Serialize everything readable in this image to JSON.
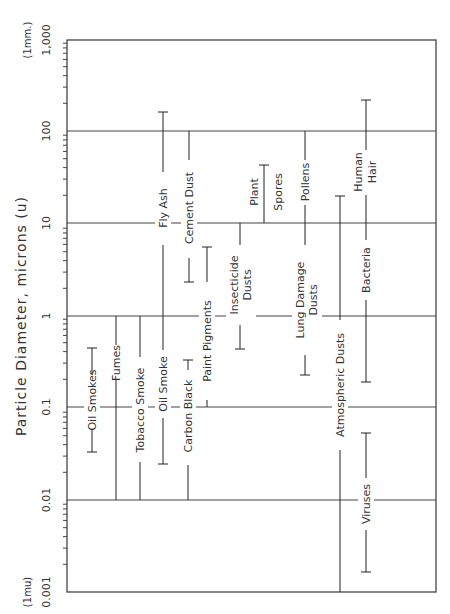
{
  "chart_data": {
    "type": "range-bar",
    "title": "",
    "ylabel": "Particle Diameter, microns (u)",
    "ylim": [
      0.001,
      1000
    ],
    "yscale": "log",
    "orientation": "rotated-90-ccw",
    "y_major_ticks": [
      "0.001",
      "0.01",
      "0.1",
      "1",
      "10",
      "100",
      "1,000"
    ],
    "y_minor_tick_labels": [
      "2",
      "3",
      "4",
      "5",
      "6",
      "8"
    ],
    "y_annotations": {
      "top": "(1mm.)",
      "bottom": "(1mu)"
    },
    "grid": "horizontal lines at each decade",
    "series": [
      {
        "name": "Oil Smokes",
        "min": 0.03,
        "max": 0.45
      },
      {
        "name": "Fumes",
        "min": 0.01,
        "max": 1
      },
      {
        "name": "Tobacco Smoke",
        "min": 0.01,
        "max": 1
      },
      {
        "name": "Oil Smoke",
        "min": 0.025,
        "max": 1
      },
      {
        "name": "Fly Ash",
        "min": 1,
        "max": 160
      },
      {
        "name": "Carbon Black",
        "min": 0.01,
        "max": 0.3
      },
      {
        "name": "Cement Dust",
        "min": 3,
        "max": 100
      },
      {
        "name": "Paint Pigments",
        "min": 0.1,
        "max": 5.5
      },
      {
        "name": "Insecticide Dusts",
        "min": 0.45,
        "max": 10
      },
      {
        "name": "Plant Spores",
        "min": 10,
        "max": 45
      },
      {
        "name": "Lung Damage Dusts",
        "min": 0.25,
        "max": 10
      },
      {
        "name": "Pollens",
        "min": 10,
        "max": 100
      },
      {
        "name": "Atmospheric Dusts",
        "min": 0.001,
        "max": 20
      },
      {
        "name": "Bacteria",
        "min": 0.2,
        "max": 10
      },
      {
        "name": "Human Hair",
        "min": 10,
        "max": 220
      },
      {
        "name": "Viruses",
        "min": 0.0017,
        "max": 0.05
      }
    ]
  },
  "labels": {
    "axis_title": "Particle Diameter, microns (u)",
    "top_note": "(1mm.)",
    "bottom_note": "(1mu)",
    "ticks": {
      "t1000": "1,000",
      "t100": "100",
      "t10": "10",
      "t1": "1",
      "t01": "0.1",
      "t001": "0.01",
      "t0001": "0.001"
    },
    "items": {
      "oil_smokes": "Oil Smokes",
      "fumes": "Fumes",
      "tobacco_smoke": "Tobacco Smoke",
      "oil_smoke": "Oil Smoke",
      "fly_ash": "Fly Ash",
      "carbon_black": "Carbon Black",
      "cement_dust": "Cement Dust",
      "paint_pigments": "Paint Pigments",
      "insecticide_1": "Insecticide",
      "insecticide_2": "Dusts",
      "plant_1": "Plant",
      "plant_2": "Spores",
      "lung_1": "Lung Damage",
      "lung_2": "Dusts",
      "pollens": "Pollens",
      "atmospheric": "Atmospheric Dusts",
      "bacteria": "Bacteria",
      "hair_1": "Human",
      "hair_2": "Hair",
      "viruses": "Viruses"
    }
  }
}
